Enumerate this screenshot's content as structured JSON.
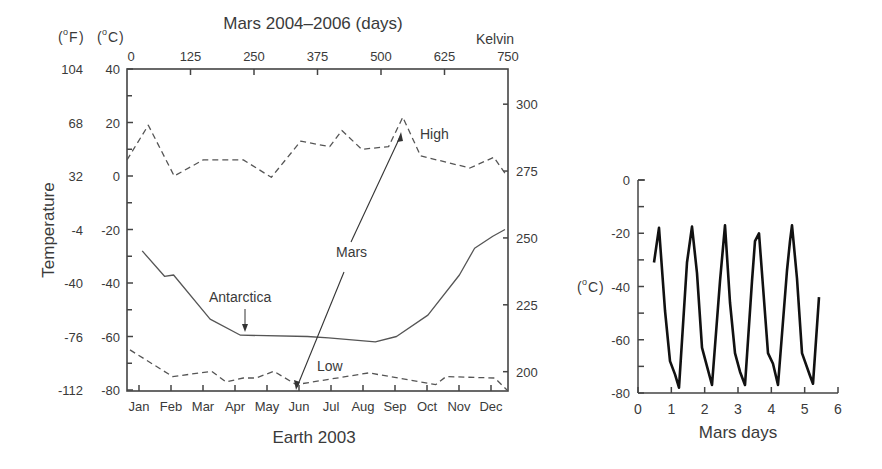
{
  "chart_data": [
    {
      "type": "line",
      "title": "Mars 2004–2006 (days)",
      "xlabel": "Earth 2003",
      "ylabel": "Temperature",
      "units": {
        "fahrenheit_label": "(oF)",
        "celsius_label": "(oC)",
        "kelvin_label": "Kelvin"
      },
      "x_bottom": {
        "label": "Earth 2003",
        "ticks": [
          "Jan",
          "Feb",
          "Mar",
          "Apr",
          "May",
          "Jun",
          "Jul",
          "Aug",
          "Sep",
          "Oct",
          "Nov",
          "Dec"
        ]
      },
      "x_top": {
        "label": "Mars 2004–2006 (days)",
        "ticks": [
          0,
          125,
          250,
          375,
          500,
          625,
          750
        ],
        "range": [
          0,
          750
        ]
      },
      "y_left_celsius": {
        "ticks": [
          40,
          20,
          0,
          -20,
          -40,
          -60,
          -80
        ],
        "range": [
          -80,
          40
        ]
      },
      "y_left_fahrenheit": {
        "ticks": [
          "104",
          "68",
          "32",
          "-4",
          "-40",
          "-76",
          "-112"
        ]
      },
      "y_right_kelvin": {
        "ticks": [
          300,
          275,
          250,
          225,
          200
        ]
      },
      "grid": false,
      "series": [
        {
          "name": "High",
          "style": "dashed",
          "axis": "mars_days",
          "x": [
            0,
            42,
            93,
            150,
            229,
            284,
            342,
            399,
            423,
            462,
            515,
            543,
            578,
            675,
            722,
            748
          ],
          "values": [
            6,
            19,
            0,
            6,
            6,
            -0.5,
            13,
            11,
            17,
            10,
            11,
            22,
            7.5,
            3,
            7,
            0
          ]
        },
        {
          "name": "Low",
          "style": "dashed",
          "axis": "mars_days",
          "x": [
            6,
            90,
            167,
            195,
            229,
            254,
            289,
            333,
            476,
            608,
            628,
            724,
            748
          ],
          "values": [
            -65,
            -75,
            -73,
            -77,
            -75.5,
            -75.5,
            -73,
            -78,
            -73.6,
            -78,
            -75,
            -75.5,
            -80
          ]
        },
        {
          "name": "Antarctica",
          "style": "solid",
          "axis": "earth_2003_days",
          "x": [
            15,
            37,
            46,
            82,
            112,
            178,
            199,
            245,
            266,
            297,
            328,
            343,
            361,
            373
          ],
          "values": [
            -28,
            -37.5,
            -37,
            -53.5,
            -59.5,
            -60,
            -60.5,
            -62,
            -60,
            -52,
            -37,
            -27,
            -22.5,
            -20
          ]
        }
      ],
      "annotations": [
        {
          "text": "High",
          "x_px": 420,
          "y_px": 134
        },
        {
          "text": "Low",
          "x_px": 318,
          "y_px": 366
        },
        {
          "text": "Mars",
          "x_px": 335,
          "y_px": 256
        },
        {
          "text": "Antarctica",
          "x_px": 210,
          "y_px": 301
        }
      ]
    },
    {
      "type": "line",
      "title": "",
      "xlabel": "Mars days",
      "ylabel": "(oC)",
      "xlim": [
        0,
        6
      ],
      "ylim": [
        -80,
        0
      ],
      "x_ticks": [
        0,
        1,
        2,
        3,
        4,
        5,
        6
      ],
      "y_ticks": [
        0,
        -20,
        -40,
        -60,
        -80
      ],
      "grid": false,
      "series": [
        {
          "name": "Mars surface temperature",
          "x": [
            0.48,
            0.63,
            0.81,
            0.96,
            1.11,
            1.23,
            1.47,
            1.62,
            1.77,
            1.92,
            2.07,
            2.22,
            2.46,
            2.61,
            2.76,
            2.91,
            3.06,
            3.21,
            3.42,
            3.51,
            3.63,
            3.75,
            3.9,
            4.05,
            4.2,
            4.47,
            4.56,
            4.62,
            4.77,
            4.92,
            5.16,
            5.25,
            5.43
          ],
          "values": [
            -31,
            -18,
            -49,
            -68,
            -73,
            -78,
            -31,
            -17.5,
            -35,
            -63,
            -70,
            -77,
            -38,
            -17,
            -46,
            -65,
            -72,
            -77,
            -38,
            -23,
            -20,
            -40,
            -65,
            -69,
            -77,
            -34,
            -23,
            -17,
            -37,
            -65,
            -73.5,
            -76.5,
            -44
          ]
        }
      ]
    }
  ],
  "labels": {
    "left_top_title": "Mars 2004–2006 (days)",
    "fahrenheit_unit": "F",
    "celsius_unit": "C",
    "degree_symbol": "o",
    "kelvin": "Kelvin",
    "temperature": "Temperature",
    "earth_2003": "Earth 2003",
    "high": "High",
    "low": "Low",
    "mars": "Mars",
    "antarctica": "Antarctica",
    "mars_days": "Mars days",
    "right_celsius_unit": "C"
  },
  "colors": {
    "ink": "#3a3a3a",
    "line": "#555555",
    "axis": "#444444",
    "curve": "#111111"
  }
}
